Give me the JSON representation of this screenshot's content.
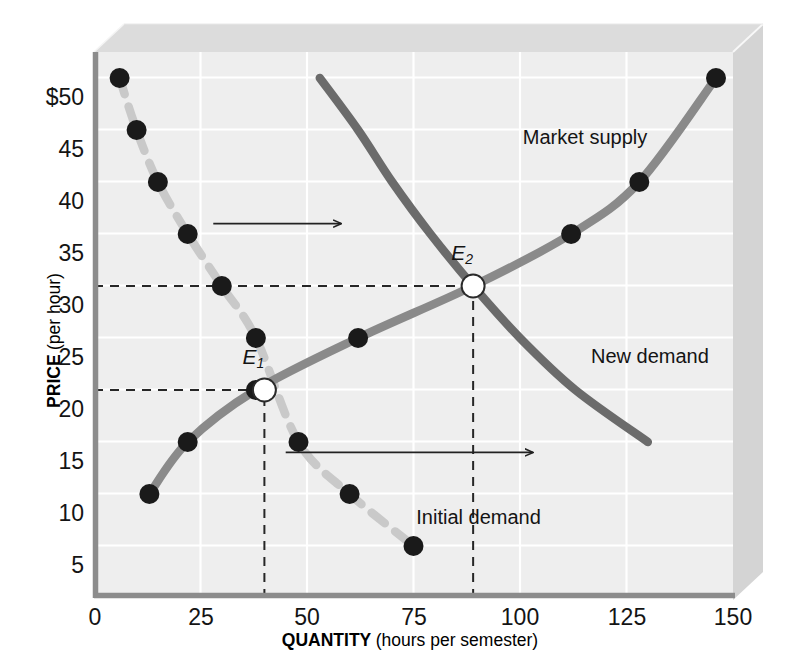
{
  "chart_data": {
    "type": "line",
    "title": "",
    "xlabel_main": "QUANTITY",
    "xlabel_unit": "(hours per semester)",
    "ylabel_main": "PRICE",
    "ylabel_unit": "(per hour)",
    "xlim": [
      0,
      150
    ],
    "ylim": [
      0,
      52.5
    ],
    "xticks": [
      "0",
      "25",
      "50",
      "75",
      "100",
      "125",
      "150"
    ],
    "xtick_values": [
      0,
      25,
      50,
      75,
      100,
      125,
      150
    ],
    "yticks": [
      "5",
      "10",
      "15",
      "20",
      "25",
      "30",
      "35",
      "40",
      "45",
      "$50"
    ],
    "ytick_values": [
      5,
      10,
      15,
      20,
      25,
      30,
      35,
      40,
      45,
      50
    ],
    "grid": true,
    "legend_position": "inline-annotations",
    "series": [
      {
        "name": "Initial demand",
        "label": "Initial demand",
        "style": "dashed",
        "color": "#c9c9c9",
        "marker": "filled-circle",
        "marker_color": "#1a1a1a",
        "points": [
          {
            "x": 6,
            "y": 50
          },
          {
            "x": 10,
            "y": 45
          },
          {
            "x": 15,
            "y": 40
          },
          {
            "x": 22,
            "y": 35
          },
          {
            "x": 30,
            "y": 30
          },
          {
            "x": 38,
            "y": 25
          },
          {
            "x": 48,
            "y": 15
          },
          {
            "x": 60,
            "y": 10
          },
          {
            "x": 75,
            "y": 5
          }
        ]
      },
      {
        "name": "Market supply",
        "label": "Market supply",
        "style": "solid",
        "color": "#8a8a8a",
        "marker": "filled-circle",
        "marker_color": "#1a1a1a",
        "points": [
          {
            "x": 13,
            "y": 10
          },
          {
            "x": 22,
            "y": 15
          },
          {
            "x": 38,
            "y": 20
          },
          {
            "x": 62,
            "y": 25
          },
          {
            "x": 89,
            "y": 30
          },
          {
            "x": 112,
            "y": 35
          },
          {
            "x": 128,
            "y": 40
          },
          {
            "x": 146,
            "y": 50
          }
        ]
      },
      {
        "name": "New demand",
        "label": "New demand",
        "style": "solid",
        "color": "#6b6b6b",
        "marker": "none",
        "points": [
          {
            "x": 53,
            "y": 50
          },
          {
            "x": 62,
            "y": 45
          },
          {
            "x": 70,
            "y": 40
          },
          {
            "x": 79,
            "y": 35
          },
          {
            "x": 89,
            "y": 30
          },
          {
            "x": 100,
            "y": 25
          },
          {
            "x": 113,
            "y": 20
          },
          {
            "x": 130,
            "y": 15
          }
        ]
      }
    ],
    "equilibria": [
      {
        "name": "E1",
        "label": "E",
        "subscript": "1",
        "x": 40,
        "y": 20,
        "marker": "open-circle"
      },
      {
        "name": "E2",
        "label": "E",
        "subscript": "2",
        "x": 89,
        "y": 30,
        "marker": "open-circle"
      }
    ],
    "guide_lines": [
      {
        "name": "price-20-guide",
        "orientation": "horizontal",
        "value": 20,
        "from_x": 0,
        "to_x": 40,
        "style": "dashed"
      },
      {
        "name": "quantity-40-guide",
        "orientation": "vertical",
        "value": 40,
        "from_y": 0,
        "to_y": 20,
        "style": "dashed"
      },
      {
        "name": "price-30-guide",
        "orientation": "horizontal",
        "value": 30,
        "from_x": 0,
        "to_x": 89,
        "style": "dashed"
      },
      {
        "name": "quantity-89-guide",
        "orientation": "vertical",
        "value": 89,
        "from_y": 0,
        "to_y": 30,
        "style": "dashed"
      }
    ],
    "shift_arrows": [
      {
        "name": "upper-shift-arrow",
        "from_x": 28,
        "to_x": 58,
        "y": 36,
        "direction": "right"
      },
      {
        "name": "lower-shift-arrow",
        "from_x": 45,
        "to_x": 103,
        "y": 14,
        "direction": "right"
      }
    ],
    "annotations": [
      {
        "name": "market-supply-label",
        "text": "Market supply",
        "x": 103,
        "y": 44
      },
      {
        "name": "new-demand-label",
        "text": "New demand",
        "x": 119,
        "y": 23
      },
      {
        "name": "initial-demand-label",
        "text": "Initial demand",
        "x": 78,
        "y": 7.5
      }
    ],
    "colors": {
      "plot_background": "#eeeeee",
      "grid": "#ffffff",
      "axis": "#8c8c8c",
      "slab_top": "#dcdcdc",
      "slab_side": "#d2d2d2",
      "text": "#141414",
      "initial_demand": "#c9c9c9",
      "market_supply": "#8a8a8a",
      "new_demand": "#6b6b6b",
      "marker": "#1a1a1a"
    }
  }
}
